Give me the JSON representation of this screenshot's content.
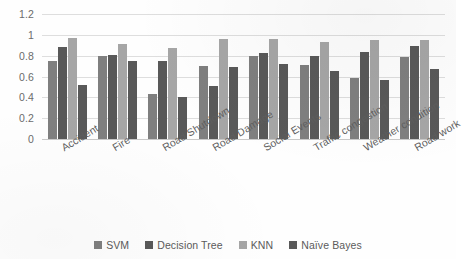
{
  "chart_data": {
    "type": "bar",
    "title": "",
    "xlabel": "",
    "ylabel": "",
    "ylim": [
      0,
      1.2
    ],
    "yticks": [
      "0",
      "0.2",
      "0.4",
      "0.6",
      "0.8",
      "1",
      "1.2"
    ],
    "ytick_values": [
      0,
      0.2,
      0.4,
      0.6,
      0.8,
      1,
      1.2
    ],
    "grid": true,
    "legend_position": "bottom",
    "categories": [
      "Accident",
      "Fire",
      "Road Shutdown",
      "Road Damage",
      "Social Events",
      "Traffic congestion",
      "Weather condition",
      "Road work"
    ],
    "series": [
      {
        "name": "SVM",
        "color": "#7f7f7f",
        "values": [
          0.75,
          0.8,
          0.43,
          0.7,
          0.8,
          0.71,
          0.59,
          0.79
        ]
      },
      {
        "name": "Decision Tree",
        "color": "#595959",
        "values": [
          0.88,
          0.81,
          0.75,
          0.51,
          0.83,
          0.8,
          0.84,
          0.89
        ]
      },
      {
        "name": "KNN",
        "color": "#a6a6a6",
        "values": [
          0.97,
          0.91,
          0.87,
          0.96,
          0.96,
          0.93,
          0.95,
          0.95
        ]
      },
      {
        "name": "Naïve Bayes",
        "color": "#595959",
        "values": [
          0.52,
          0.75,
          0.4,
          0.69,
          0.72,
          0.65,
          0.57,
          0.67
        ]
      }
    ]
  }
}
